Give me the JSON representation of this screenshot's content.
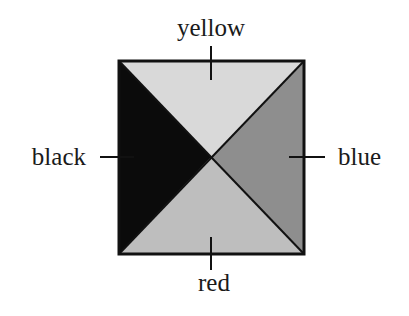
{
  "diagram": {
    "square": {
      "x": 119,
      "y": 61,
      "width": 185,
      "height": 193
    },
    "regions": [
      {
        "id": "top",
        "label": "yellow",
        "fill": "#d9d9d9"
      },
      {
        "id": "right",
        "label": "blue",
        "fill": "#8e8e8e"
      },
      {
        "id": "bottom",
        "label": "red",
        "fill": "#bebebe"
      },
      {
        "id": "left",
        "label": "black",
        "fill": "#0b0b0b"
      }
    ],
    "labels": {
      "top": "yellow",
      "right": "blue",
      "bottom": "red",
      "left": "black"
    },
    "stroke_color": "#111111"
  }
}
